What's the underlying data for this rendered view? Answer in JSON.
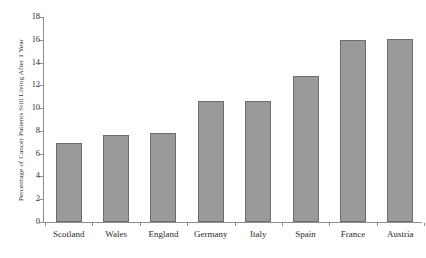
{
  "chart_data": {
    "type": "bar",
    "title": "",
    "subtitle": "",
    "xlabel": "",
    "ylabel": "Percentage of Cancer Patients Still Living After 1 Year",
    "categories": [
      "Scotland",
      "Wales",
      "England",
      "Germany",
      "Italy",
      "Spain",
      "France",
      "Austria"
    ],
    "values": [
      6.9,
      7.6,
      7.8,
      10.6,
      10.6,
      12.8,
      16.0,
      16.1
    ],
    "ylim": [
      0,
      18
    ],
    "ytick_step": 2,
    "ytick_labels": [
      "0",
      "2",
      "4",
      "6",
      "8",
      "10",
      "12",
      "14",
      "16",
      "18"
    ],
    "grid": false,
    "legend": null,
    "annotations": [],
    "series": [
      {
        "name": "Percentage of Cancer Patients Still Living After 1 Year",
        "values": [
          6.9,
          7.6,
          7.8,
          10.6,
          10.6,
          12.8,
          16.0,
          16.1
        ]
      }
    ]
  },
  "style": {
    "bar_fill": "#9a9a9a",
    "bar_stroke": "#6d6d6d",
    "axis_color": "#8e8e8e",
    "text_color": "#2b2b2b",
    "background": "#ffffff"
  }
}
